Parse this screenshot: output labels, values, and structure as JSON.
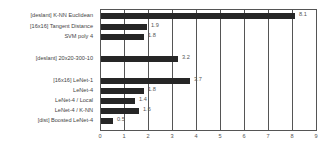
{
  "chart_data": {
    "type": "bar",
    "orientation": "horizontal",
    "title": "",
    "xlabel": "",
    "ylabel": "",
    "xlim": [
      0,
      9
    ],
    "x_ticks": [
      "0",
      "1",
      "2",
      "3",
      "4",
      "5",
      "6",
      "7",
      "8",
      "9"
    ],
    "grid": true,
    "legend": null,
    "categories": [
      "[deslant] K-NN Euclidean",
      "[16x16] Tangent Distance",
      "SVM poly 4",
      "[deslant] 20x20-300-10",
      "[16x16] LeNet-1",
      "LeNet-4",
      "LeNet-4 / Local",
      "LeNet-4 / K-NN",
      "[dist] Boosted LeNet-4"
    ],
    "values": [
      8.1,
      1.9,
      1.8,
      3.2,
      3.7,
      1.8,
      1.4,
      1.6,
      0.5
    ],
    "value_labels": [
      "8.1",
      "1.9",
      "1.8",
      "3.2",
      "3.7",
      "1.8",
      "1.4",
      "1.6",
      "0.5"
    ],
    "value_label_offsets": [
      0,
      0,
      0,
      0,
      0,
      0,
      0,
      0,
      0
    ],
    "row_y": [
      16,
      27,
      37,
      59,
      81,
      91,
      101,
      111,
      121
    ],
    "bar_color": "#262626"
  }
}
